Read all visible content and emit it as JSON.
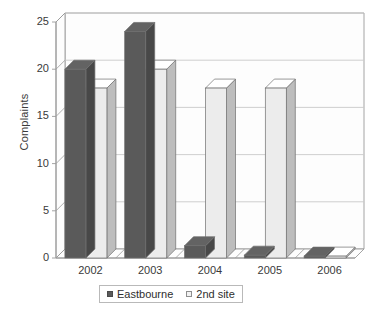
{
  "chart_data": {
    "type": "bar",
    "title": "",
    "subtitle": "",
    "xlabel": "",
    "ylabel": "Complaints",
    "categories": [
      "2002",
      "2003",
      "2004",
      "2005",
      "2006"
    ],
    "series": [
      {
        "name": "Eastbourne",
        "color": "#5a5a5a",
        "values": [
          20,
          24,
          1.3,
          0.3,
          0.2
        ]
      },
      {
        "name": "2nd site",
        "color": "#ececec",
        "values": [
          18,
          20,
          18,
          18,
          0.2
        ]
      }
    ],
    "ylim": [
      0,
      25
    ],
    "yticks": [
      0,
      5,
      10,
      15,
      20,
      25
    ],
    "ytick_labels": [
      "0",
      "5",
      "10",
      "15",
      "20",
      "25"
    ],
    "grid": "horizontal",
    "legend_position": "bottom",
    "style": "3d-column",
    "annotations": []
  },
  "axes": {
    "y_title": "Complaints"
  },
  "legend": {
    "entries": [
      {
        "label": "Eastbourne",
        "swatch": "dark"
      },
      {
        "label": "2nd site",
        "swatch": "light"
      }
    ]
  }
}
